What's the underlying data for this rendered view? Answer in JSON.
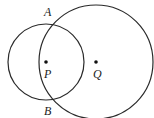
{
  "diagram": {
    "type": "two-intersecting-circles",
    "colors": {
      "stroke": "#2a2a2a",
      "background": "#ffffff"
    },
    "circles": [
      {
        "name": "circle-P",
        "center_label": "P",
        "cx": 46,
        "cy": 62,
        "r": 38
      },
      {
        "name": "circle-Q",
        "center_label": "Q",
        "cx": 96,
        "cy": 62,
        "r": 57
      }
    ],
    "points": [
      {
        "label": "A",
        "x": 52,
        "y": 23
      },
      {
        "label": "B",
        "x": 52,
        "y": 101
      },
      {
        "label": "P",
        "x": 46,
        "y": 62
      },
      {
        "label": "Q",
        "x": 96,
        "y": 62
      }
    ],
    "labels": {
      "A": "A",
      "B": "B",
      "P": "P",
      "Q": "Q"
    }
  }
}
